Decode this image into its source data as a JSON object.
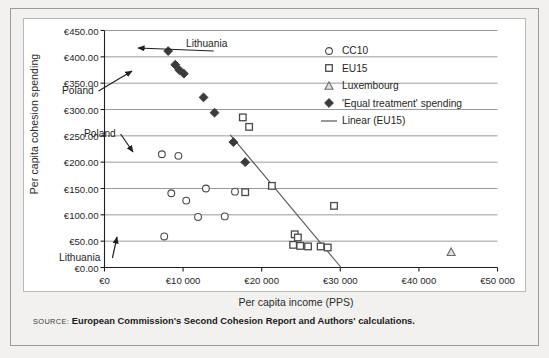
{
  "figure": {
    "source_label": "SOURCE:",
    "source_text": "European Commission's Second Cohesion Report and Authors' calculations."
  },
  "colors": {
    "page_background": "#f2f1ef",
    "plot_background": "#ffffff",
    "frame_border": "#9a9a96",
    "gridline": "#8f8f8f",
    "axis": "#1f1f1f",
    "marker_open": "#4a4a4a",
    "marker_filled": "#3b3b3b",
    "trendline": "#555555"
  },
  "legend": {
    "position": "inside-top-right",
    "items": [
      {
        "label": "CC10",
        "marker": "circle-open",
        "icon": "circle-open-icon"
      },
      {
        "label": "EU15",
        "marker": "square-open",
        "icon": "square-open-icon"
      },
      {
        "label": "Luxembourg",
        "marker": "triangle-open",
        "icon": "triangle-open-icon"
      },
      {
        "label": "'Equal treatment' spending",
        "marker": "diamond-filled",
        "icon": "diamond-filled-icon"
      },
      {
        "label": "Linear (EU15)",
        "marker": "line",
        "icon": "line-segment-icon"
      }
    ]
  },
  "annotations": [
    {
      "text": "Lithuania",
      "id": "annot-lithuania-top",
      "x": 186,
      "y": 38,
      "arrow_to": {
        "x": 138,
        "y": 48
      }
    },
    {
      "text": "Poland",
      "id": "annot-poland-diamond",
      "x": 62,
      "y": 85,
      "arrow_to": {
        "x": 132,
        "y": 71
      }
    },
    {
      "text": "Poland",
      "id": "annot-poland-circle",
      "x": 84,
      "y": 128,
      "arrow_to": {
        "x": 133,
        "y": 152
      }
    },
    {
      "text": "Lithuania",
      "id": "annot-lithuania-bottom",
      "x": 59,
      "y": 252,
      "arrow_to": {
        "x": 117,
        "y": 237
      }
    }
  ],
  "chart_data": {
    "type": "scatter",
    "title": "",
    "xlabel": "Per capita income  (PPS)",
    "ylabel": "Per capita cohesion spending",
    "xlim": [
      0,
      50000
    ],
    "ylim": [
      0,
      450
    ],
    "xticks": [
      0,
      10000,
      20000,
      30000,
      40000,
      50000
    ],
    "xticklabels": [
      "€0",
      "€10 000",
      "€20 000",
      "€30 000",
      "€40 000",
      "€50 000"
    ],
    "yticks": [
      0,
      50,
      100,
      150,
      200,
      250,
      300,
      350,
      400,
      450
    ],
    "yticklabels": [
      "€0.00",
      "€50.00",
      "€100.00",
      "€150.00",
      "€200.00",
      "€250.00",
      "€300.00",
      "€350.00",
      "€400.00",
      "€450.00"
    ],
    "grid": "horizontal",
    "series": [
      {
        "name": "CC10",
        "marker": "circle-open",
        "points": [
          {
            "x": 7300,
            "y": 215
          },
          {
            "x": 9400,
            "y": 212
          },
          {
            "x": 8500,
            "y": 141
          },
          {
            "x": 10400,
            "y": 127
          },
          {
            "x": 11900,
            "y": 96
          },
          {
            "x": 12900,
            "y": 150
          },
          {
            "x": 15300,
            "y": 97
          },
          {
            "x": 16600,
            "y": 144
          },
          {
            "x": 7600,
            "y": 59
          }
        ]
      },
      {
        "name": "EU15",
        "marker": "square-open",
        "points": [
          {
            "x": 17600,
            "y": 285
          },
          {
            "x": 18400,
            "y": 267
          },
          {
            "x": 17900,
            "y": 143
          },
          {
            "x": 21300,
            "y": 155
          },
          {
            "x": 24200,
            "y": 63
          },
          {
            "x": 24600,
            "y": 57
          },
          {
            "x": 24000,
            "y": 43
          },
          {
            "x": 24900,
            "y": 41
          },
          {
            "x": 25900,
            "y": 40
          },
          {
            "x": 27500,
            "y": 40
          },
          {
            "x": 28400,
            "y": 38
          },
          {
            "x": 29200,
            "y": 117
          }
        ]
      },
      {
        "name": "Luxembourg",
        "marker": "triangle-open",
        "points": [
          {
            "x": 44100,
            "y": 29
          }
        ]
      },
      {
        "name": "'Equal treatment' spending",
        "marker": "diamond-filled",
        "points": [
          {
            "x": 8100,
            "y": 411
          },
          {
            "x": 9000,
            "y": 385
          },
          {
            "x": 9500,
            "y": 375
          },
          {
            "x": 10100,
            "y": 368
          },
          {
            "x": 12600,
            "y": 323
          },
          {
            "x": 14000,
            "y": 294
          },
          {
            "x": 16400,
            "y": 238
          },
          {
            "x": 17900,
            "y": 200
          }
        ]
      }
    ],
    "trendline": {
      "name": "Linear (EU15)",
      "from": {
        "x": 16000,
        "y": 252
      },
      "to": {
        "x": 30100,
        "y": 0
      }
    }
  }
}
